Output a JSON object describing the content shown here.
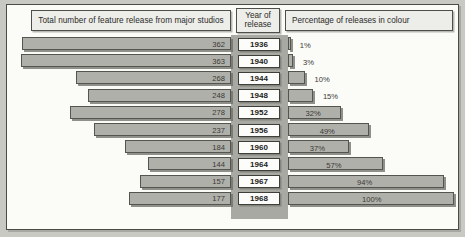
{
  "headers": {
    "left": "Total number of feature release from major studios",
    "year_line1": "Year of",
    "year_line2": "release",
    "right": "Percentage of releases in colour"
  },
  "colors": {
    "bar_fill": "#b0b0ab",
    "bar_border": "#55554f",
    "center_band": "#a9a9a4",
    "panel_background": "#fbfbf8",
    "outer_background": "#c9c9c4",
    "header_fill": "#ededea",
    "year_box_fill": "#fcfcfa"
  },
  "chart_data": {
    "type": "bar",
    "title": "",
    "orientation": "bidirectional-horizontal",
    "categories": [
      "1936",
      "1940",
      "1944",
      "1948",
      "1952",
      "1956",
      "1960",
      "1964",
      "1967",
      "1968"
    ],
    "xlabel": "",
    "ylabel": "Year of release",
    "grid": false,
    "legend_position": "none",
    "series": [
      {
        "name": "Total number of feature release from major studios",
        "side": "left",
        "unit": "releases",
        "ylim": [
          0,
          363
        ],
        "values": [
          362,
          363,
          268,
          248,
          278,
          237,
          184,
          144,
          157,
          177
        ],
        "labels": [
          "362",
          "363",
          "268",
          "248",
          "278",
          "237",
          "184",
          "144",
          "157",
          "177"
        ]
      },
      {
        "name": "Percentage of releases in colour",
        "side": "right",
        "unit": "%",
        "ylim": [
          0,
          100
        ],
        "values": [
          1,
          3,
          10,
          15,
          32,
          49,
          37,
          57,
          94,
          100
        ],
        "labels": [
          "1%",
          "3%",
          "10%",
          "15%",
          "32%",
          "49%",
          "37%",
          "57%",
          "94%",
          "100%"
        ]
      }
    ]
  }
}
